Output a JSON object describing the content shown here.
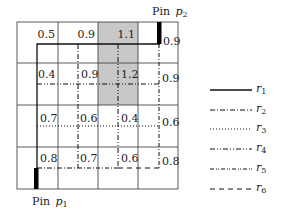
{
  "diagram": {
    "grid": {
      "rows": 4,
      "cols": 4,
      "cells": [
        [
          "",
          "0.5",
          "0.9",
          "1.1",
          "0.9"
        ],
        [
          "",
          "0.4",
          "0.9",
          "1.2",
          "0.9"
        ],
        [
          "",
          "0.7",
          "0.6",
          "0.4",
          "0.6"
        ],
        [
          "",
          "0.8",
          "0.7",
          "0.6",
          "0.8"
        ]
      ],
      "congestion_labels": {
        "row1": [
          "0.5",
          "0.9",
          "1.1",
          "0.9"
        ],
        "row2": [
          "0.4",
          "0.9",
          "1.2",
          "0.9"
        ],
        "row3": [
          "0.7",
          "0.6",
          "0.4",
          "0.6"
        ],
        "row4": [
          "0.8",
          "0.7",
          "0.6",
          "0.8"
        ]
      },
      "shaded_cells": [
        [
          0,
          2
        ],
        [
          1,
          2
        ]
      ],
      "shade_color": "#c8c8c8"
    },
    "pins": {
      "p1": {
        "label": "Pin",
        "sub": "p",
        "index": "1"
      },
      "p2": {
        "label": "Pin",
        "sub": "p",
        "index": "2"
      }
    },
    "legend": [
      {
        "name": "r",
        "index": "1",
        "style": "solid"
      },
      {
        "name": "r",
        "index": "2",
        "style": "dash-dot"
      },
      {
        "name": "r",
        "index": "3",
        "style": "dotted"
      },
      {
        "name": "r",
        "index": "4",
        "style": "dash-dot-dot"
      },
      {
        "name": "r",
        "index": "5",
        "style": "dash-dot-dot-dot"
      },
      {
        "name": "r",
        "index": "6",
        "style": "dashed"
      }
    ]
  }
}
